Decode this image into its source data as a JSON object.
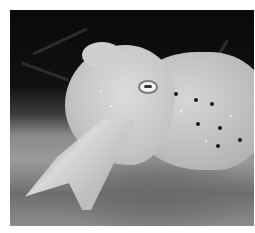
{
  "image": {
    "subject": "cuttlefish",
    "style": "grayscale photograph",
    "background_color": "#ffffff",
    "photo_bounds": {
      "x": 10,
      "y": 10,
      "width": 244,
      "height": 216
    }
  }
}
